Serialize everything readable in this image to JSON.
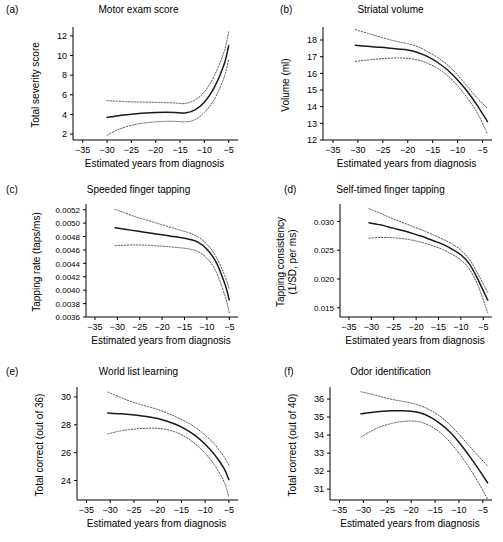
{
  "figure": {
    "title": "",
    "xlabel": "Estimated years from diagnosis",
    "xticks": [
      "-35",
      "-30",
      "-25",
      "-20",
      "-15",
      "-10",
      "-5"
    ],
    "xlim": [
      -37,
      -3.5
    ],
    "line_colors": {
      "fit": "#1a1a1a",
      "ci": "#555555"
    }
  },
  "chart_data": [
    {
      "type": "line",
      "panel": "a",
      "label": "(a)",
      "title": "Motor exam score",
      "xlabel": "Estimated years from diagnosis",
      "ylabel": "Total severity score",
      "xlim": [
        -37,
        -3.5
      ],
      "ylim": [
        1.4,
        12.6
      ],
      "yticks": [
        2,
        4,
        6,
        8,
        10,
        12
      ],
      "ytick_labels": [
        "2",
        "4",
        "6",
        "8",
        "10",
        "12"
      ],
      "grid": false,
      "legend": "none",
      "x": [
        -30,
        -28,
        -26,
        -24,
        -22,
        -20,
        -18,
        -16,
        -14,
        -12,
        -10,
        -8,
        -6,
        -5
      ],
      "series": [
        {
          "name": "fit",
          "style": "solid",
          "values": [
            3.7,
            3.85,
            3.97,
            4.07,
            4.15,
            4.2,
            4.22,
            4.2,
            4.16,
            4.45,
            5.25,
            6.7,
            9.0,
            11.0
          ]
        },
        {
          "name": "upper 95% CI",
          "style": "dotted",
          "values": [
            5.4,
            5.35,
            5.3,
            5.27,
            5.25,
            5.23,
            5.2,
            5.17,
            5.12,
            5.45,
            6.3,
            7.9,
            10.3,
            12.4
          ]
        },
        {
          "name": "lower 95% CI",
          "style": "dotted",
          "values": [
            1.9,
            2.4,
            2.75,
            3.0,
            3.15,
            3.25,
            3.3,
            3.3,
            3.25,
            3.45,
            4.2,
            5.5,
            7.7,
            9.6
          ]
        }
      ]
    },
    {
      "type": "line",
      "panel": "b",
      "label": "(b)",
      "title": "Striatal volume",
      "xlabel": "Estimated years from diagnosis",
      "ylabel": "Volume (ml)",
      "xlim": [
        -37,
        -3.5
      ],
      "ylim": [
        12,
        18.6
      ],
      "yticks": [
        12,
        13,
        14,
        15,
        16,
        17,
        18
      ],
      "ytick_labels": [
        "12",
        "13",
        "14",
        "15",
        "16",
        "17",
        "18"
      ],
      "grid": false,
      "legend": "none",
      "x": [
        -30.5,
        -28,
        -26,
        -24,
        -22,
        -20,
        -18,
        -16,
        -14,
        -12,
        -10,
        -8,
        -6,
        -4
      ],
      "series": [
        {
          "name": "fit",
          "style": "solid",
          "values": [
            17.68,
            17.62,
            17.57,
            17.52,
            17.46,
            17.4,
            17.25,
            17.0,
            16.65,
            16.2,
            15.6,
            14.9,
            14.05,
            13.1
          ]
        },
        {
          "name": "upper 95% CI",
          "style": "dotted",
          "values": [
            18.62,
            18.4,
            18.22,
            18.05,
            17.9,
            17.78,
            17.6,
            17.3,
            16.95,
            16.5,
            15.9,
            15.2,
            14.5,
            13.9
          ]
        },
        {
          "name": "lower 95% CI",
          "style": "dotted",
          "values": [
            16.72,
            16.8,
            16.86,
            16.9,
            16.92,
            16.9,
            16.8,
            16.6,
            16.3,
            15.85,
            15.25,
            14.5,
            13.6,
            12.35
          ]
        }
      ]
    },
    {
      "type": "line",
      "panel": "c",
      "label": "(c)",
      "title": "Speeded finger tapping",
      "xlabel": "Estimated years from diagnosis",
      "ylabel": "Tapping rate (taps/ms)",
      "xlim": [
        -37,
        -3.5
      ],
      "ylim": [
        0.0036,
        0.00524
      ],
      "yticks": [
        0.0036,
        0.0038,
        0.004,
        0.0042,
        0.0044,
        0.0046,
        0.0048,
        0.005,
        0.0052
      ],
      "ytick_labels": [
        "0.0036",
        "0.0038",
        "0.0040",
        "0.0042",
        "0.0044",
        "0.0046",
        "0.0048",
        "0.0050",
        "0.0052"
      ],
      "grid": false,
      "legend": "none",
      "x": [
        -30.5,
        -28,
        -26,
        -24,
        -22,
        -20,
        -18,
        -16,
        -14,
        -12,
        -10,
        -8,
        -6,
        -5
      ],
      "series": [
        {
          "name": "fit",
          "style": "solid",
          "values": [
            0.00493,
            0.004905,
            0.004885,
            0.004865,
            0.004845,
            0.004825,
            0.004805,
            0.004785,
            0.00476,
            0.004715,
            0.00461,
            0.004425,
            0.004095,
            0.003855
          ]
        },
        {
          "name": "upper 95% CI",
          "style": "dotted",
          "values": [
            0.005205,
            0.005145,
            0.005095,
            0.005055,
            0.005015,
            0.004975,
            0.004935,
            0.004895,
            0.004855,
            0.004795,
            0.004685,
            0.004505,
            0.004215,
            0.004015
          ]
        },
        {
          "name": "lower 95% CI",
          "style": "dotted",
          "values": [
            0.004665,
            0.004672,
            0.004675,
            0.004672,
            0.004665,
            0.004655,
            0.004645,
            0.004632,
            0.004615,
            0.004575,
            0.004475,
            0.004285,
            0.003925,
            0.003665
          ]
        }
      ]
    },
    {
      "type": "line",
      "panel": "d",
      "label": "(d)",
      "title": "Self-timed finger tapping",
      "xlabel": "Estimated years from diagnosis",
      "ylabel": "Tapping consistency (1/SD, per ms)",
      "xlim": [
        -37,
        -3.5
      ],
      "ylim": [
        0.0134,
        0.0325
      ],
      "yticks": [
        0.015,
        0.02,
        0.025,
        0.03
      ],
      "ytick_labels": [
        "0.015",
        "0.020",
        "0.025",
        "0.030"
      ],
      "grid": false,
      "legend": "none",
      "x": [
        -30.5,
        -28,
        -26,
        -24,
        -22,
        -20,
        -18,
        -16,
        -14,
        -12,
        -10,
        -8,
        -6,
        -4
      ],
      "series": [
        {
          "name": "fit",
          "style": "solid",
          "values": [
            0.02975,
            0.0294,
            0.029,
            0.0286,
            0.0282,
            0.0277,
            0.0272,
            0.0266,
            0.026,
            0.0252,
            0.0242,
            0.0225,
            0.0196,
            0.0163
          ]
        },
        {
          "name": "upper 95% CI",
          "style": "dotted",
          "values": [
            0.0322,
            0.0314,
            0.0307,
            0.0301,
            0.0295,
            0.0289,
            0.0283,
            0.0276,
            0.0269,
            0.0261,
            0.025,
            0.0233,
            0.0206,
            0.0177
          ]
        },
        {
          "name": "lower 95% CI",
          "style": "dotted",
          "values": [
            0.0271,
            0.0272,
            0.0272,
            0.0271,
            0.0269,
            0.0266,
            0.0262,
            0.0257,
            0.0251,
            0.0243,
            0.0233,
            0.0216,
            0.0185,
            0.0141
          ]
        }
      ]
    },
    {
      "type": "line",
      "panel": "e",
      "label": "(e)",
      "title": "World list learning",
      "xlabel": "Estimated years from diagnosis",
      "ylabel": "Total correct (out of 36)",
      "xlim": [
        -37,
        -3.5
      ],
      "ylim": [
        22.6,
        30.5
      ],
      "yticks": [
        24,
        26,
        28,
        30
      ],
      "ytick_labels": [
        "24",
        "26",
        "28",
        "30"
      ],
      "grid": false,
      "legend": "none",
      "x": [
        -30.5,
        -28,
        -26,
        -24,
        -22,
        -20,
        -18,
        -16,
        -14,
        -12,
        -10,
        -8,
        -6,
        -5
      ],
      "series": [
        {
          "name": "fit",
          "style": "solid",
          "values": [
            28.85,
            28.8,
            28.74,
            28.67,
            28.58,
            28.45,
            28.25,
            28.0,
            27.65,
            27.2,
            26.6,
            25.85,
            24.85,
            24.05
          ]
        },
        {
          "name": "upper 95% CI",
          "style": "dotted",
          "values": [
            30.35,
            30.0,
            29.72,
            29.5,
            29.3,
            29.1,
            28.85,
            28.55,
            28.2,
            27.8,
            27.25,
            26.6,
            25.7,
            25.1
          ]
        },
        {
          "name": "lower 95% CI",
          "style": "dotted",
          "values": [
            27.35,
            27.55,
            27.65,
            27.72,
            27.75,
            27.75,
            27.65,
            27.45,
            27.1,
            26.6,
            25.95,
            25.1,
            23.9,
            22.8
          ]
        }
      ]
    },
    {
      "type": "line",
      "panel": "f",
      "label": "(f)",
      "title": "Odor identification",
      "xlabel": "Estimated years from diagnosis",
      "ylabel": "Total correct (out of 40)",
      "xlim": [
        -37,
        -3.5
      ],
      "ylim": [
        30.4,
        36.5
      ],
      "yticks": [
        31,
        32,
        33,
        34,
        35,
        36
      ],
      "ytick_labels": [
        "31",
        "32",
        "33",
        "34",
        "35",
        "36"
      ],
      "grid": false,
      "legend": "none",
      "x": [
        -30.5,
        -28,
        -26,
        -24,
        -22,
        -20,
        -18,
        -16,
        -14,
        -12,
        -10,
        -8,
        -6,
        -4
      ],
      "series": [
        {
          "name": "fit",
          "style": "solid",
          "values": [
            35.18,
            35.27,
            35.32,
            35.35,
            35.35,
            35.32,
            35.22,
            35.0,
            34.65,
            34.2,
            33.6,
            32.9,
            32.15,
            31.35
          ]
        },
        {
          "name": "upper 95% CI",
          "style": "dotted",
          "values": [
            36.4,
            36.25,
            36.1,
            35.98,
            35.88,
            35.78,
            35.62,
            35.38,
            35.05,
            34.6,
            34.05,
            33.45,
            32.85,
            32.3
          ]
        },
        {
          "name": "lower 95% CI",
          "style": "dotted",
          "values": [
            33.9,
            34.28,
            34.5,
            34.65,
            34.75,
            34.78,
            34.72,
            34.5,
            34.15,
            33.65,
            33.0,
            32.25,
            31.4,
            30.45
          ]
        }
      ]
    }
  ]
}
